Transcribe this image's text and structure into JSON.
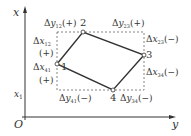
{
  "axes": {
    "vertical_label": "x",
    "horizontal_label": "y",
    "origin_label": "O",
    "tick_label": "x",
    "tick_sub": "1"
  },
  "vertices": [
    {
      "id": "1",
      "x": 57,
      "y": 64
    },
    {
      "id": "2",
      "x": 83,
      "y": 32
    },
    {
      "id": "3",
      "x": 144,
      "y": 55
    },
    {
      "id": "4",
      "x": 113,
      "y": 90
    }
  ],
  "labels": {
    "dy12": {
      "delta": "Δ",
      "var": "y",
      "sub": "12",
      "sign": "(+)"
    },
    "dy23": {
      "delta": "Δ",
      "var": "y",
      "sub": "23",
      "sign": "(+)"
    },
    "dx12": {
      "delta": "Δ",
      "var": "x",
      "sub": "12",
      "sign": "(+)"
    },
    "dx23": {
      "delta": "Δ",
      "var": "x",
      "sub": "23",
      "sign": "(−)"
    },
    "dx41": {
      "delta": "Δ",
      "var": "x",
      "sub": "41",
      "sign": "(+)"
    },
    "dx34": {
      "delta": "Δ",
      "var": "x",
      "sub": "34",
      "sign": "(−)"
    },
    "dy41": {
      "delta": "Δ",
      "var": "y",
      "sub": "41",
      "sign": "(−)"
    },
    "dy34": {
      "delta": "Δ",
      "var": "y",
      "sub": "34",
      "sign": "(−)"
    }
  },
  "colors": {
    "line": "#333333",
    "dashed": "#666666"
  }
}
